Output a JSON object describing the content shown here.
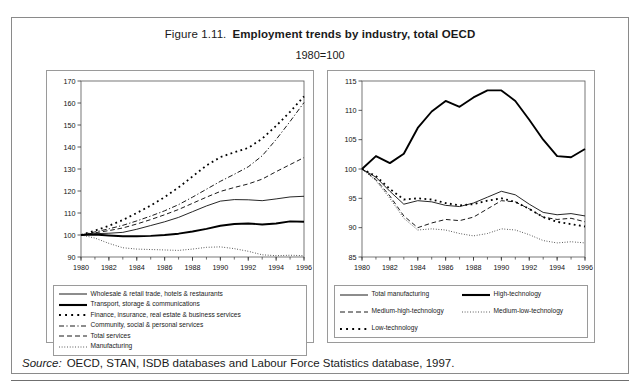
{
  "figure": {
    "number": "Figure 1.11.",
    "name": "Employment trends by industry, total OECD",
    "subtitle": "1980=100",
    "source_label": "Source:",
    "source_text": "OECD, STAN, ISDB databases and Labour Force Statistics database, 1997."
  },
  "chart_data": [
    {
      "type": "line",
      "id": "left-panel-services",
      "title": "Employment trends by industry, total OECD",
      "subtitle": "1980=100",
      "xlabel": "",
      "ylabel": "",
      "xlim": [
        1980,
        1996
      ],
      "ylim": [
        90,
        170
      ],
      "yticks": [
        90,
        100,
        110,
        120,
        130,
        140,
        150,
        160,
        170
      ],
      "xticks": [
        1980,
        1982,
        1984,
        1986,
        1988,
        1990,
        1992,
        1994,
        1996
      ],
      "xtick_labels": [
        "1980",
        "1982",
        "1984",
        "1986",
        "1988",
        "1990",
        "1992",
        "1994",
        "1996"
      ],
      "minor_xticks_every": 1,
      "grid": false,
      "legend_position": "below",
      "x": [
        1980,
        1981,
        1982,
        1983,
        1984,
        1985,
        1986,
        1987,
        1988,
        1989,
        1990,
        1991,
        1992,
        1993,
        1994,
        1995,
        1996
      ],
      "series": [
        {
          "name": "Wholesale & retail trade, hotels & restaurants",
          "style": "solid-thin",
          "values": [
            100,
            100.6,
            100.8,
            101.2,
            102.6,
            104.3,
            106.0,
            108.0,
            110.6,
            113.2,
            115.4,
            116.1,
            116.0,
            115.6,
            116.4,
            117.3,
            117.6
          ]
        },
        {
          "name": "Transport, storage & communications",
          "style": "solid-thick",
          "values": [
            100,
            100.2,
            99.8,
            99.4,
            99.4,
            99.6,
            100.0,
            100.6,
            101.6,
            102.8,
            104.2,
            105.0,
            105.2,
            104.8,
            105.2,
            106.2,
            106.0
          ]
        },
        {
          "name": "Finance, insurance, real estate & business services",
          "style": "square-dot",
          "values": [
            100,
            102.0,
            104.2,
            106.8,
            110.0,
            113.4,
            117.2,
            121.6,
            126.6,
            131.6,
            135.4,
            137.6,
            139.6,
            143.8,
            149.6,
            156.0,
            163.0
          ]
        },
        {
          "name": "Community, social & personal services",
          "style": "dash-dot",
          "values": [
            100,
            101.4,
            102.8,
            104.4,
            106.4,
            108.6,
            111.0,
            113.8,
            117.2,
            120.8,
            124.4,
            127.6,
            131.0,
            136.0,
            143.4,
            151.6,
            160.2
          ]
        },
        {
          "name": "Total services",
          "style": "dashed",
          "values": [
            100,
            101.0,
            102.0,
            103.2,
            105.0,
            107.0,
            109.2,
            111.6,
            114.4,
            117.2,
            119.8,
            121.6,
            123.2,
            125.4,
            128.8,
            132.0,
            135.2
          ]
        },
        {
          "name": "Manufacturing",
          "style": "fine-dot",
          "values": [
            100,
            98.6,
            96.2,
            94.2,
            93.6,
            93.4,
            93.2,
            93.0,
            93.6,
            94.4,
            94.6,
            93.8,
            92.6,
            91.0,
            90.6,
            90.8,
            90.6
          ]
        }
      ]
    },
    {
      "type": "line",
      "id": "right-panel-manufacturing",
      "title": "Employment trends by industry, total OECD",
      "subtitle": "1980=100",
      "xlabel": "",
      "ylabel": "",
      "xlim": [
        1980,
        1996
      ],
      "ylim": [
        85,
        115
      ],
      "yticks": [
        85,
        90,
        95,
        100,
        105,
        110,
        115
      ],
      "xticks": [
        1980,
        1982,
        1984,
        1986,
        1988,
        1990,
        1992,
        1994,
        1996
      ],
      "xtick_labels": [
        "1980",
        "1982",
        "1984",
        "1986",
        "1988",
        "1990",
        "1992",
        "1994",
        "1996"
      ],
      "minor_xticks_every": 1,
      "grid": false,
      "legend_position": "below",
      "x": [
        1980,
        1981,
        1982,
        1983,
        1984,
        1985,
        1986,
        1987,
        1988,
        1989,
        1990,
        1991,
        1992,
        1993,
        1994,
        1995,
        1996
      ],
      "series": [
        {
          "name": "Total manufacturing",
          "style": "solid-thin",
          "values": [
            100,
            98.6,
            96.2,
            94.0,
            94.6,
            94.4,
            93.8,
            93.6,
            94.2,
            95.2,
            96.2,
            95.6,
            94.0,
            92.6,
            92.2,
            92.4,
            92.0
          ]
        },
        {
          "name": "High-technology",
          "style": "solid-thick",
          "values": [
            100,
            102.2,
            101.0,
            102.6,
            107.0,
            109.8,
            111.6,
            110.6,
            112.2,
            113.4,
            113.4,
            111.6,
            108.4,
            105.0,
            102.2,
            102.0,
            103.4
          ]
        },
        {
          "name": "Medium-high-technology",
          "style": "dashed",
          "values": [
            100,
            98.2,
            95.4,
            92.0,
            90.0,
            90.8,
            91.4,
            91.2,
            91.8,
            93.2,
            94.6,
            94.4,
            93.2,
            91.8,
            91.4,
            91.6,
            91.0
          ]
        },
        {
          "name": "Medium-low-technology",
          "style": "fine-dot",
          "values": [
            100,
            98.0,
            95.0,
            91.6,
            89.6,
            89.8,
            89.6,
            89.0,
            88.6,
            89.0,
            89.8,
            89.6,
            88.8,
            87.8,
            87.4,
            87.6,
            87.4
          ]
        },
        {
          "name": "Low-technology",
          "style": "square-dot",
          "values": [
            100,
            98.8,
            96.6,
            94.8,
            95.0,
            94.8,
            94.2,
            93.8,
            94.0,
            94.6,
            95.0,
            94.4,
            93.2,
            91.8,
            91.0,
            90.6,
            90.2
          ]
        }
      ]
    }
  ]
}
